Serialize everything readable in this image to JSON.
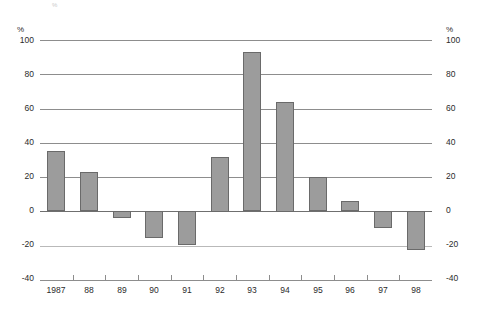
{
  "chart_data": {
    "type": "bar",
    "title": "",
    "subtitle": "",
    "xlabel": "",
    "ylabel": "%",
    "ylabel_right": "%",
    "categories": [
      "1987",
      "88",
      "89",
      "90",
      "91",
      "92",
      "93",
      "94",
      "95",
      "96",
      "97",
      "98"
    ],
    "values": [
      35,
      23,
      -4,
      -16,
      -20,
      32,
      93,
      64,
      20,
      6,
      -10,
      -23
    ],
    "series": [
      {
        "name": "",
        "values": [
          35,
          23,
          -4,
          -16,
          -20,
          32,
          93,
          64,
          20,
          6,
          -10,
          -23
        ]
      }
    ],
    "ylim": [
      -40,
      100
    ],
    "yticks": [
      100,
      80,
      60,
      40,
      20,
      0,
      -20,
      -40
    ],
    "ytick_labels": [
      "100",
      "80",
      "60",
      "40",
      "20",
      "0",
      "-20",
      "-40"
    ],
    "grid": true,
    "legend": "none",
    "bar_color": "#9c9c9c",
    "bar_border_color": "#6a6a6a",
    "gridline_color": "#8d8d8d",
    "axis_text_color": "#2b2b2b",
    "background": "#ffffff",
    "unit_symbol": "%"
  },
  "axis": {
    "unit_left": "%",
    "unit_right": "%",
    "left_ticks": [
      "100",
      "80",
      "60",
      "40",
      "20",
      "0",
      "-20",
      "-40"
    ],
    "right_ticks": [
      "100",
      "80",
      "60",
      "40",
      "20",
      "0",
      "-20",
      "-40"
    ]
  },
  "artifact": {
    "top_mark": "%"
  }
}
